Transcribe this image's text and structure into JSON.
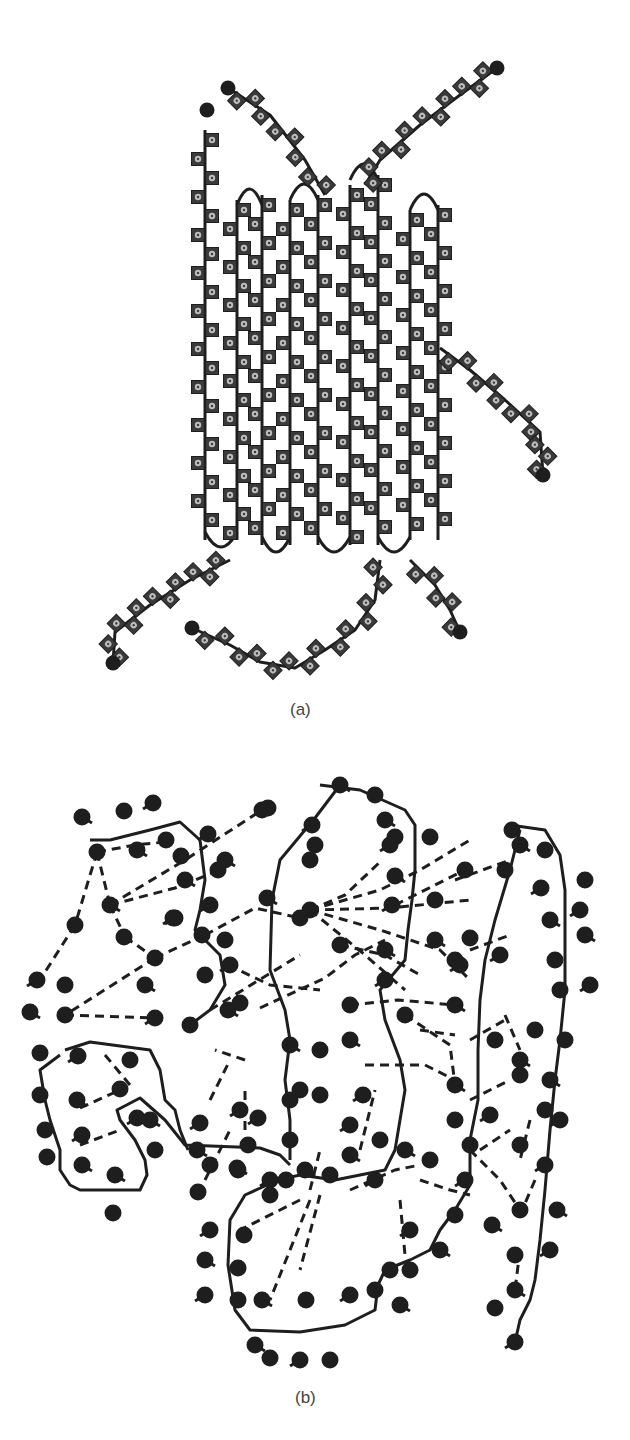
{
  "figure": {
    "panels": [
      {
        "id": "a",
        "label": "(a)",
        "description": "folded chain of square residues forming antiparallel strands"
      },
      {
        "id": "b",
        "label": "(b)",
        "description": "network of bead residues with solid backbone and dashed contacts"
      }
    ],
    "colors": {
      "ink": "#1e1e1e",
      "square_fill": "#3a3a3a",
      "square_mark": "#bdbdbd",
      "label": "#444444",
      "background": "#ffffff"
    }
  }
}
